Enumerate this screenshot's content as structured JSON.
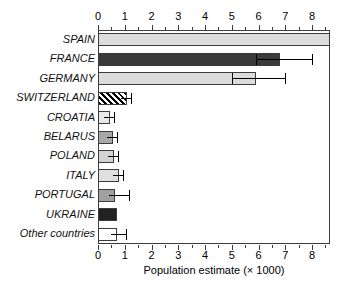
{
  "chart_data": {
    "type": "bar",
    "orientation": "horizontal",
    "title": "",
    "subtitle": "",
    "xlabel": "Population estimate (× 1000)",
    "ylabel": "",
    "xlim": [
      0,
      8.67
    ],
    "xticks": [
      0,
      1,
      2,
      3,
      4,
      5,
      6,
      7,
      8
    ],
    "xtick_labels": [
      "0",
      "1",
      "2",
      "3",
      "4",
      "5",
      "6",
      "7",
      "8"
    ],
    "minor_tick_step": 0.5,
    "grid": false,
    "legend": "none",
    "axis_positions": [
      "top",
      "bottom"
    ],
    "categories": [
      "SPAIN",
      "FRANCE",
      "GERMANY",
      "SWITZERLAND",
      "CROATIA",
      "BELARUS",
      "POLAND",
      "ITALY",
      "PORTUGAL",
      "UKRAINE",
      "Other countries"
    ],
    "values": [
      8.67,
      6.8,
      5.9,
      1.1,
      0.45,
      0.55,
      0.6,
      0.8,
      0.65,
      0.7,
      0.7
    ],
    "error_low": [
      null,
      5.9,
      5.0,
      null,
      null,
      null,
      null,
      null,
      null,
      null,
      null
    ],
    "error_high": [
      null,
      8.0,
      7.0,
      1.25,
      0.58,
      0.72,
      0.75,
      0.95,
      1.15,
      null,
      1.05
    ],
    "bars": [
      {
        "label": "SPAIN",
        "value": 8.67,
        "fill": "#dcdcdc",
        "pattern": "solid",
        "err_low": null,
        "err_high": null
      },
      {
        "label": "FRANCE",
        "value": 6.8,
        "fill": "#3a3a3a",
        "pattern": "solid",
        "err_low": 5.9,
        "err_high": 8.0
      },
      {
        "label": "GERMANY",
        "value": 5.9,
        "fill": "#dcdcdc",
        "pattern": "solid",
        "err_low": 5.0,
        "err_high": 7.0
      },
      {
        "label": "SWITZERLAND",
        "value": 1.1,
        "fill": "#ffffff",
        "pattern": "hatch",
        "err_low": null,
        "err_high": 1.25
      },
      {
        "label": "CROATIA",
        "value": 0.45,
        "fill": "#e8e8e8",
        "pattern": "solid",
        "err_low": null,
        "err_high": 0.58
      },
      {
        "label": "BELARUS",
        "value": 0.55,
        "fill": "#a8a8a8",
        "pattern": "solid",
        "err_low": null,
        "err_high": 0.72
      },
      {
        "label": "POLAND",
        "value": 0.6,
        "fill": "#d2d2d2",
        "pattern": "solid",
        "err_low": null,
        "err_high": 0.75
      },
      {
        "label": "ITALY",
        "value": 0.8,
        "fill": "#e0e0e0",
        "pattern": "solid",
        "err_low": null,
        "err_high": 0.95
      },
      {
        "label": "PORTUGAL",
        "value": 0.65,
        "fill": "#a0a0a0",
        "pattern": "solid",
        "err_low": null,
        "err_high": 1.15
      },
      {
        "label": "UKRAINE",
        "value": 0.7,
        "fill": "#222222",
        "pattern": "solid",
        "err_low": null,
        "err_high": null
      },
      {
        "label": "Other countries",
        "value": 0.7,
        "fill": "#ffffff",
        "pattern": "solid",
        "err_low": null,
        "err_high": 1.05
      }
    ],
    "colors": {
      "axis": "#3c3c3c",
      "text": "#000000",
      "background": "#ffffff",
      "error_bar": "#000000"
    }
  }
}
